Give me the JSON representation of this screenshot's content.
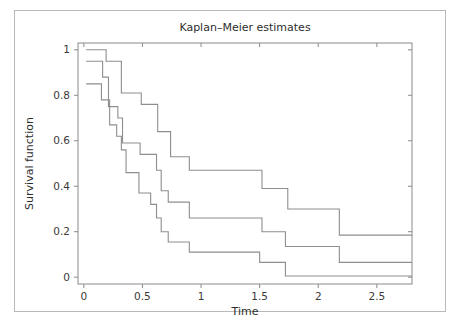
{
  "figure": {
    "caption_fragment": ""
  },
  "chart_data": {
    "type": "line",
    "title": "Kaplan–Meier estimates",
    "xlabel": "Time",
    "ylabel": "Survival function",
    "xlim": [
      -0.05,
      2.8
    ],
    "ylim": [
      -0.03,
      1.03
    ],
    "xticks": [
      0,
      0.5,
      1,
      1.5,
      2,
      2.5
    ],
    "xtick_labels": [
      "0",
      "0.5",
      "1",
      "1.5",
      "2",
      "2.5"
    ],
    "yticks": [
      0,
      0.2,
      0.4,
      0.6,
      0.8,
      1
    ],
    "ytick_labels": [
      "0",
      "0.2",
      "0.4",
      "0.6",
      "0.8",
      "1"
    ],
    "grid": false,
    "legend": "none",
    "line_color": "#8e8e8e",
    "step_style": "post",
    "series": [
      {
        "name": "upper-confidence-band",
        "x": [
          0.02,
          0.17,
          0.19,
          0.3,
          0.32,
          0.47,
          0.49,
          0.6,
          0.63,
          0.72,
          0.74,
          0.88,
          0.9,
          1.5,
          1.52,
          1.72,
          1.74,
          2.16,
          2.18,
          2.8
        ],
        "y": [
          1.0,
          1.0,
          0.95,
          0.95,
          0.81,
          0.81,
          0.76,
          0.76,
          0.64,
          0.64,
          0.53,
          0.53,
          0.47,
          0.47,
          0.39,
          0.39,
          0.3,
          0.3,
          0.185,
          0.185
        ]
      },
      {
        "name": "survival-estimate",
        "x": [
          0.02,
          0.14,
          0.16,
          0.19,
          0.21,
          0.27,
          0.29,
          0.31,
          0.33,
          0.46,
          0.48,
          0.6,
          0.62,
          0.64,
          0.66,
          0.7,
          0.72,
          0.88,
          0.9,
          1.5,
          1.52,
          1.7,
          1.72,
          2.16,
          2.18,
          2.8
        ],
        "y": [
          0.95,
          0.95,
          0.88,
          0.88,
          0.75,
          0.75,
          0.7,
          0.7,
          0.59,
          0.59,
          0.54,
          0.54,
          0.47,
          0.47,
          0.38,
          0.38,
          0.33,
          0.33,
          0.26,
          0.26,
          0.2,
          0.2,
          0.135,
          0.135,
          0.065,
          0.065
        ]
      },
      {
        "name": "lower-confidence-band",
        "x": [
          0.02,
          0.13,
          0.15,
          0.2,
          0.22,
          0.26,
          0.28,
          0.3,
          0.32,
          0.34,
          0.36,
          0.45,
          0.47,
          0.55,
          0.57,
          0.6,
          0.62,
          0.64,
          0.66,
          0.7,
          0.72,
          0.88,
          0.9,
          1.48,
          1.5,
          1.7,
          1.72,
          2.8
        ],
        "y": [
          0.85,
          0.85,
          0.78,
          0.78,
          0.67,
          0.67,
          0.62,
          0.62,
          0.56,
          0.56,
          0.46,
          0.46,
          0.37,
          0.37,
          0.32,
          0.32,
          0.26,
          0.26,
          0.2,
          0.2,
          0.155,
          0.155,
          0.11,
          0.11,
          0.065,
          0.065,
          0.005,
          0.005
        ]
      }
    ]
  }
}
